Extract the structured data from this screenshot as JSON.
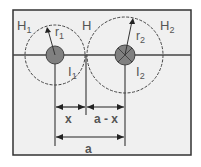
{
  "diagram": {
    "labels": {
      "H1": "H",
      "H1_sub": "1",
      "r1": "r",
      "r1_sub": "1",
      "H": "H",
      "I1": "I",
      "I1_sub": "1",
      "r2": "r",
      "r2_sub": "2",
      "H2": "H",
      "H2_sub": "2",
      "I2": "I",
      "I2_sub": "2",
      "x": "x",
      "a_minus_x": "a - x",
      "a": "a"
    },
    "colors": {
      "frame": "#333333",
      "background": "#f0f0f0",
      "conductor": "#808080",
      "line": "#444444"
    }
  }
}
